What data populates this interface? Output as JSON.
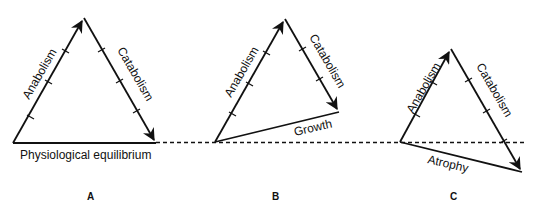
{
  "figure": {
    "baseline_label": "Physiological equilibrium",
    "panels": [
      {
        "id": "A",
        "label": "A",
        "left_side": "Anabolism",
        "right_side": "Catabolism",
        "bottom_side": "",
        "vertices": {
          "left": [
            13,
            143
          ],
          "apex": [
            84,
            18
          ],
          "right": [
            156,
            143
          ]
        }
      },
      {
        "id": "B",
        "label": "B",
        "left_side": "Anabolism",
        "right_side": "Catabolism",
        "bottom_side": "Growth",
        "vertices": {
          "left": [
            215,
            142
          ],
          "apex": [
            285,
            19
          ],
          "right": [
            339,
            112
          ]
        }
      },
      {
        "id": "C",
        "label": "C",
        "left_side": "Anabolism",
        "right_side": "Catabolism",
        "bottom_side": "Atrophy",
        "vertices": {
          "left": [
            400,
            142
          ],
          "apex": [
            451,
            49
          ],
          "right": [
            522,
            172
          ]
        }
      }
    ],
    "colors": {
      "line": "#111111",
      "background": "#ffffff"
    }
  }
}
